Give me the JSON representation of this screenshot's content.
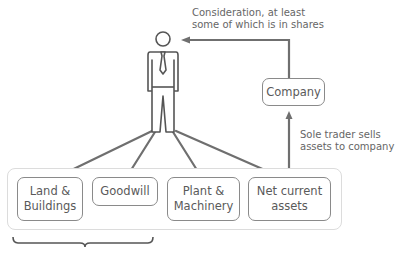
{
  "diagram": {
    "figure": {
      "name": "Sole trader",
      "icon": "businessman-icon"
    },
    "consideration_label": "Consideration, at least\nsome of which is in shares",
    "company_label": "Company",
    "sale_label": "Sole trader sells\nassets to company",
    "assets": [
      {
        "label": "Land &\nBuildings"
      },
      {
        "label": "Goodwill"
      },
      {
        "label": "Plant &\nMachinery"
      },
      {
        "label": "Net current\nassets"
      }
    ],
    "colors": {
      "line": "#6f6f6f",
      "box_border": "#8a8a8a",
      "outer_border": "#dcdcdc",
      "text": "#5a5a5a"
    }
  }
}
